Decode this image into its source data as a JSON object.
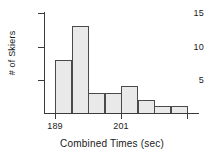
{
  "chart_data": {
    "type": "bar",
    "title": "",
    "subtitle": "",
    "xlabel": "Combined Times (sec)",
    "ylabel": "# of Skiers",
    "categories": [
      "189-193",
      "193-197",
      "197-201",
      "201-205",
      "205-209",
      "209-213",
      "213-217",
      "217-221"
    ],
    "bin_starts": [
      189,
      193,
      197,
      201,
      205,
      209,
      213,
      217
    ],
    "bin_width": 4,
    "values": [
      8,
      13,
      3,
      3,
      4,
      2,
      1,
      1
    ],
    "xlim": [
      189,
      221
    ],
    "ylim": [
      0,
      15
    ],
    "x_ticks": [
      189,
      201
    ],
    "x_tick_labels": [
      "189",
      "201"
    ],
    "y_ticks": [
      5,
      10,
      15
    ],
    "y_tick_labels": [
      "5",
      "10",
      "15"
    ],
    "grid": false,
    "legend": null,
    "bar_fill_color": "#e9e9e9",
    "bar_border_color": "#4a4a4a",
    "axis_color": "#3a3a3a",
    "background_color": "#ffffff"
  }
}
